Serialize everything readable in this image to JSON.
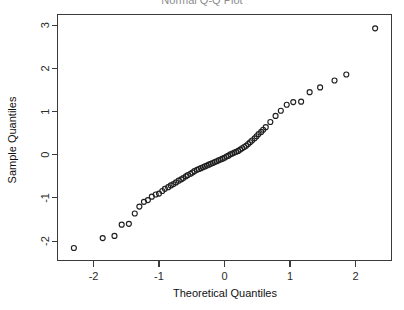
{
  "figure": {
    "title": "Normal Q-Q Plot",
    "title_clipped": true,
    "background": "#ffffff",
    "point_color": "#1f1f1f",
    "axis_color": "#3a3a3a"
  },
  "chart_data": {
    "type": "scatter",
    "title": "Normal Q-Q Plot",
    "xlabel": "Theoretical Quantiles",
    "ylabel": "Sample Quantiles",
    "xlim": [
      -2.55,
      2.55
    ],
    "ylim": [
      -2.45,
      3.25
    ],
    "xticks": [
      -2,
      -1,
      0,
      1,
      2
    ],
    "xticklabels": [
      "-2",
      "-1",
      "0",
      "1",
      "2"
    ],
    "yticks": [
      -2,
      -1,
      0,
      1,
      2,
      3
    ],
    "yticklabels": [
      "-2",
      "-1",
      "0",
      "1",
      "2",
      "3"
    ],
    "grid": false,
    "legend": null,
    "marker": "open-circle",
    "n_points": 72,
    "series": [
      {
        "name": "Sample Quantiles vs Theoretical Quantiles",
        "x": [
          -2.3,
          -1.86,
          -1.68,
          -1.57,
          -1.46,
          -1.37,
          -1.3,
          -1.23,
          -1.17,
          -1.11,
          -1.05,
          -1.0,
          -0.95,
          -0.91,
          -0.86,
          -0.82,
          -0.78,
          -0.74,
          -0.7,
          -0.66,
          -0.63,
          -0.59,
          -0.56,
          -0.52,
          -0.49,
          -0.46,
          -0.42,
          -0.39,
          -0.36,
          -0.33,
          -0.3,
          -0.27,
          -0.24,
          -0.21,
          -0.18,
          -0.15,
          -0.12,
          -0.09,
          -0.06,
          -0.03,
          0.0,
          0.03,
          0.06,
          0.09,
          0.12,
          0.15,
          0.18,
          0.21,
          0.24,
          0.27,
          0.3,
          0.33,
          0.36,
          0.39,
          0.42,
          0.46,
          0.49,
          0.52,
          0.56,
          0.59,
          0.63,
          0.7,
          0.78,
          0.86,
          0.95,
          1.05,
          1.17,
          1.3,
          1.46,
          1.68,
          1.86,
          2.3
        ],
        "y": [
          -2.16,
          -1.93,
          -1.88,
          -1.62,
          -1.6,
          -1.36,
          -1.2,
          -1.09,
          -1.05,
          -0.97,
          -0.92,
          -0.9,
          -0.84,
          -0.79,
          -0.75,
          -0.71,
          -0.68,
          -0.64,
          -0.6,
          -0.57,
          -0.54,
          -0.5,
          -0.47,
          -0.44,
          -0.41,
          -0.38,
          -0.35,
          -0.33,
          -0.31,
          -0.29,
          -0.27,
          -0.25,
          -0.23,
          -0.21,
          -0.19,
          -0.17,
          -0.15,
          -0.13,
          -0.11,
          -0.09,
          -0.07,
          -0.04,
          -0.02,
          0.01,
          0.03,
          0.05,
          0.07,
          0.09,
          0.12,
          0.15,
          0.18,
          0.21,
          0.25,
          0.29,
          0.33,
          0.38,
          0.43,
          0.48,
          0.53,
          0.58,
          0.64,
          0.76,
          0.9,
          1.02,
          1.16,
          1.22,
          1.23,
          1.45,
          1.56,
          1.72,
          1.86,
          2.93
        ]
      }
    ]
  }
}
